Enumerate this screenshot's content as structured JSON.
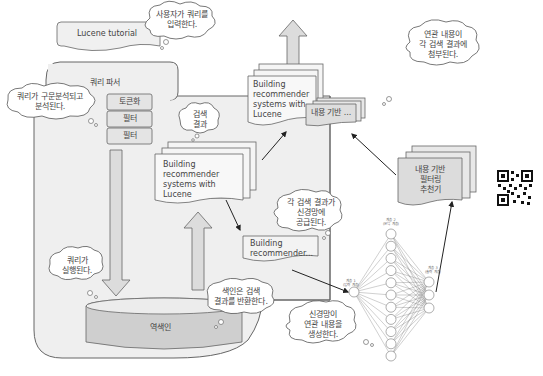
{
  "diagram": {
    "type": "flow",
    "query_box": {
      "label": "Lucene tutorial"
    },
    "query_parser": {
      "title": "쿼리 파서",
      "steps": [
        "토큰화",
        "필터",
        "필터"
      ]
    },
    "search_results": {
      "label": "검색\n결과",
      "doc_text": "Building\nrecommender\nsystems with\nLucene"
    },
    "enriched_result": {
      "doc_text": "Building\nrecommender\nsystems with\nLucene",
      "attachment_label": "내용 기반 ..."
    },
    "single_result": {
      "doc_text": "Building\nrecommender..."
    },
    "inverted_index": {
      "label": "역색인"
    },
    "recommender": {
      "label": "내용 기반\n필터링\n추천기"
    },
    "neural_net": {
      "layers": [
        {
          "label": "계층 1\n(입력 계층)",
          "nodes": 1
        },
        {
          "label": "계층 2\n(은닉 계층)",
          "nodes": 11
        },
        {
          "label": "계층 3\n(출력 계층)",
          "nodes": 3
        }
      ]
    },
    "callouts": {
      "user_query": "사용자가 쿼리를\n입력한다.",
      "parsed": "쿼리가 구문분석되고\n분석된다.",
      "executed": "쿼리가\n실행된다.",
      "index_returns": "색인은 검색\n결과를 반환한다.",
      "fed_to_net": "각 검색 결과가\n신경망에\n공급된다.",
      "net_generates": "신경망이\n연관 내용을\n생성한다.",
      "attached": "연관 내용이\n각 검색 결과에\n첨부된다."
    },
    "colors": {
      "container_fill": "#efefef",
      "box_fill": "#e2e2e2",
      "doc_fill": "#f5f5f5",
      "stroke": "#555555",
      "arrow": "#222222"
    }
  }
}
